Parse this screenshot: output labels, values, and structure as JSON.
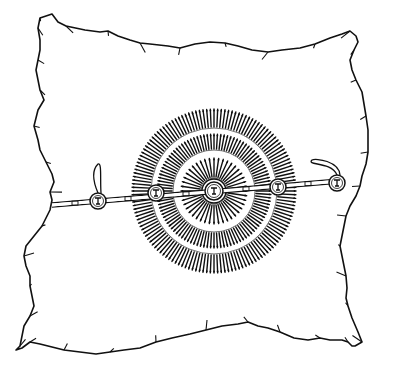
{
  "image": {
    "subject": "line drawing of an animal hide with concentric radiating rosette design and horizontal strap with medallions",
    "width": 408,
    "height": 380,
    "colors": {
      "background": "#ffffff",
      "ink": "#111111"
    }
  },
  "hide": {
    "outline_points": [
      [
        40,
        18
      ],
      [
        52,
        14
      ],
      [
        58,
        22
      ],
      [
        66,
        26
      ],
      [
        85,
        30
      ],
      [
        100,
        32
      ],
      [
        108,
        31
      ],
      [
        118,
        36
      ],
      [
        130,
        40
      ],
      [
        140,
        43
      ],
      [
        150,
        44
      ],
      [
        168,
        46
      ],
      [
        180,
        48
      ],
      [
        195,
        44
      ],
      [
        210,
        42
      ],
      [
        225,
        43
      ],
      [
        238,
        46
      ],
      [
        252,
        50
      ],
      [
        268,
        52
      ],
      [
        282,
        50
      ],
      [
        300,
        48
      ],
      [
        315,
        44
      ],
      [
        330,
        38
      ],
      [
        342,
        34
      ],
      [
        350,
        31
      ],
      [
        356,
        36
      ],
      [
        358,
        42
      ],
      [
        354,
        50
      ],
      [
        350,
        60
      ],
      [
        352,
        70
      ],
      [
        356,
        80
      ],
      [
        362,
        92
      ],
      [
        364,
        104
      ],
      [
        366,
        116
      ],
      [
        368,
        130
      ],
      [
        368,
        144
      ],
      [
        368,
        152
      ],
      [
        366,
        164
      ],
      [
        362,
        176
      ],
      [
        360,
        186
      ],
      [
        356,
        196
      ],
      [
        350,
        206
      ],
      [
        346,
        216
      ],
      [
        344,
        226
      ],
      [
        342,
        236
      ],
      [
        340,
        246
      ],
      [
        342,
        256
      ],
      [
        344,
        266
      ],
      [
        346,
        276
      ],
      [
        347,
        288
      ],
      [
        346,
        298
      ],
      [
        348,
        306
      ],
      [
        352,
        318
      ],
      [
        358,
        332
      ],
      [
        362,
        342
      ],
      [
        355,
        346
      ],
      [
        352,
        346
      ],
      [
        348,
        342
      ],
      [
        342,
        340
      ],
      [
        330,
        340
      ],
      [
        320,
        338
      ],
      [
        308,
        340
      ],
      [
        294,
        338
      ],
      [
        280,
        332
      ],
      [
        268,
        328
      ],
      [
        258,
        326
      ],
      [
        248,
        322
      ],
      [
        238,
        324
      ],
      [
        222,
        326
      ],
      [
        206,
        330
      ],
      [
        190,
        334
      ],
      [
        172,
        338
      ],
      [
        156,
        342
      ],
      [
        140,
        348
      ],
      [
        124,
        350
      ],
      [
        110,
        352
      ],
      [
        96,
        354
      ],
      [
        80,
        352
      ],
      [
        64,
        350
      ],
      [
        48,
        346
      ],
      [
        40,
        344
      ],
      [
        30,
        342
      ],
      [
        22,
        348
      ],
      [
        16,
        350
      ],
      [
        20,
        346
      ],
      [
        22,
        336
      ],
      [
        24,
        326
      ],
      [
        30,
        316
      ],
      [
        34,
        306
      ],
      [
        32,
        296
      ],
      [
        30,
        286
      ],
      [
        30,
        276
      ],
      [
        26,
        266
      ],
      [
        24,
        256
      ],
      [
        26,
        246
      ],
      [
        34,
        236
      ],
      [
        42,
        226
      ],
      [
        50,
        210
      ],
      [
        52,
        200
      ],
      [
        50,
        192
      ],
      [
        54,
        182
      ],
      [
        52,
        174
      ],
      [
        46,
        162
      ],
      [
        40,
        150
      ],
      [
        38,
        140
      ],
      [
        34,
        126
      ],
      [
        38,
        110
      ],
      [
        44,
        100
      ],
      [
        40,
        90
      ],
      [
        38,
        80
      ],
      [
        36,
        70
      ],
      [
        38,
        60
      ],
      [
        40,
        50
      ],
      [
        40,
        40
      ],
      [
        38,
        28
      ]
    ]
  },
  "rosette": {
    "center": [
      214,
      191
    ],
    "rings": [
      {
        "name": "outer-ring",
        "inner_r": 64,
        "outer_r": 82,
        "rays": 140
      },
      {
        "name": "middle-ring",
        "inner_r": 42,
        "outer_r": 57,
        "rays": 104
      },
      {
        "name": "inner-sun",
        "inner_r": 14,
        "outer_r": 33,
        "rays": 44
      }
    ],
    "center_medallion_r": 12
  },
  "strap": {
    "y_left": 205,
    "y_right": 181,
    "x_start": 52,
    "x_end": 340,
    "medallions": [
      {
        "name": "medallion-far-left",
        "cx": 98,
        "cy": 201,
        "r": 8
      },
      {
        "name": "medallion-left",
        "cx": 156,
        "cy": 193,
        "r": 8
      },
      {
        "name": "medallion-center",
        "cx": 214,
        "cy": 191,
        "r": 9
      },
      {
        "name": "medallion-right",
        "cx": 278,
        "cy": 187,
        "r": 8
      },
      {
        "name": "medallion-far-right",
        "cx": 337,
        "cy": 183,
        "r": 8
      }
    ],
    "loops": [
      {
        "name": "left-loop",
        "from": [
          98,
          193
        ],
        "to": [
          98,
          164
        ]
      },
      {
        "name": "right-loop",
        "from": [
          337,
          175
        ],
        "to": [
          312,
          160
        ]
      }
    ]
  }
}
